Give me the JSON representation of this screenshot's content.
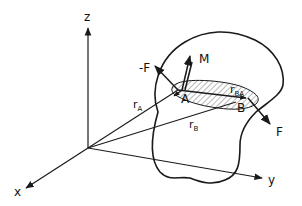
{
  "diagram": {
    "axes": {
      "x_label": "x",
      "y_label": "y",
      "z_label": "z"
    },
    "points": {
      "A": "A",
      "B": "B"
    },
    "vectors": {
      "force_pos": "F",
      "force_neg": "-F",
      "moment": "M",
      "rA": {
        "main": "r",
        "sub": "A"
      },
      "rB": {
        "main": "r",
        "sub": "B"
      },
      "rBA": {
        "main": "r",
        "sub": "BA"
      }
    },
    "colors": {
      "ink": "#1a1a1a",
      "background": "#ffffff"
    }
  }
}
